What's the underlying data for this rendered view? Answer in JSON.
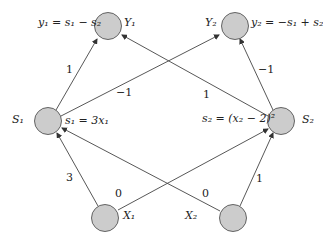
{
  "colors": {
    "node_fill": "#cccccc",
    "node_stroke": "#555555",
    "edge": "#333333",
    "background": "#ffffff"
  },
  "nodes": {
    "Y1": {
      "label": "Y₁",
      "equation": "y₁ = s₁ − s₂"
    },
    "Y2": {
      "label": "Y₂",
      "equation": "y₂ = −s₁ + s₂"
    },
    "S1": {
      "label": "S₁",
      "equation": "s₁ = 3x₁"
    },
    "S2": {
      "label": "S₂",
      "equation": "s₂ = (x₂ − 2)²"
    },
    "X1": {
      "label": "X₁"
    },
    "X2": {
      "label": "X₂"
    }
  },
  "edges": [
    {
      "from": "S1",
      "to": "Y1",
      "weight": "1"
    },
    {
      "from": "S1",
      "to": "Y2",
      "weight": "−1"
    },
    {
      "from": "S2",
      "to": "Y1",
      "weight": "1"
    },
    {
      "from": "S2",
      "to": "Y2",
      "weight": "−1"
    },
    {
      "from": "X1",
      "to": "S1",
      "weight": "3"
    },
    {
      "from": "X1",
      "to": "S2",
      "weight": "0"
    },
    {
      "from": "X2",
      "to": "S1",
      "weight": "0"
    },
    {
      "from": "X2",
      "to": "S2",
      "weight": "1"
    }
  ]
}
